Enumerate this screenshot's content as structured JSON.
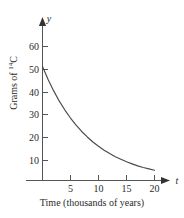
{
  "chart_data": {
    "type": "line",
    "title": "",
    "subtitle": "",
    "xlabel": "Time (thousands of years)",
    "ylabel": "Grams of 14C",
    "ylabel_base": "Grams of ",
    "ylabel_superscript": "14",
    "ylabel_element": "C",
    "x_axis_variable": "t",
    "y_axis_variable": "y",
    "xlim": [
      0,
      23
    ],
    "ylim": [
      0,
      66
    ],
    "xticks": [
      5,
      10,
      15,
      20
    ],
    "yticks": [
      10,
      20,
      30,
      40,
      50,
      60
    ],
    "xtick_labels": [
      "5",
      "10",
      "15",
      "20"
    ],
    "ytick_labels": [
      "10",
      "20",
      "30",
      "40",
      "50",
      "60"
    ],
    "grid": false,
    "legend": "none",
    "initial_amount": 50,
    "half_life": 5.73,
    "annotations": [],
    "series": [
      {
        "name": "Carbon-14 remaining",
        "color": "#4a4a4a",
        "x": [
          0,
          1,
          2,
          3,
          4,
          5,
          6,
          7,
          8,
          9,
          10,
          11,
          12,
          13,
          14,
          15,
          16,
          17,
          18,
          19,
          20
        ],
        "y": [
          50.0,
          44.3,
          39.3,
          34.8,
          30.9,
          27.4,
          24.3,
          21.5,
          19.1,
          16.9,
          15.0,
          13.3,
          11.8,
          10.4,
          9.3,
          8.2,
          7.3,
          6.4,
          5.7,
          5.1,
          4.5
        ]
      }
    ]
  }
}
